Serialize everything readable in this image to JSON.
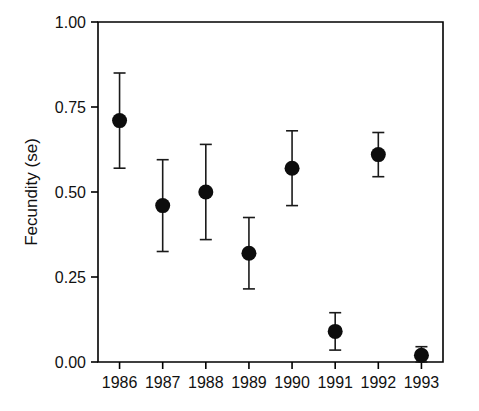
{
  "chart_data": {
    "type": "scatter",
    "title": "",
    "xlabel": "",
    "ylabel": "Fecundity (se)",
    "categories": [
      "1986",
      "1987",
      "1988",
      "1989",
      "1990",
      "1991",
      "1992",
      "1993"
    ],
    "values": [
      0.71,
      0.46,
      0.5,
      0.32,
      0.57,
      0.09,
      0.61,
      0.02
    ],
    "errors": [
      0.14,
      0.135,
      0.14,
      0.105,
      0.11,
      0.055,
      0.065,
      0.025
    ],
    "error_type": "se",
    "ylim": [
      0.0,
      1.0
    ],
    "yticks": [
      0.0,
      0.25,
      0.5,
      0.75,
      1.0
    ],
    "ytick_labels": [
      "0.00",
      "0.25",
      "0.50",
      "0.75",
      "1.00"
    ],
    "xtick_labels": [
      "1986",
      "1987",
      "1988",
      "1989",
      "1990",
      "1991",
      "1992",
      "1993"
    ],
    "grid": false,
    "legend": false,
    "marker": "filled-circle",
    "marker_color": "#0d0d0d",
    "points": [
      {
        "x": "1986",
        "y": 0.71,
        "err": 0.14,
        "low": 0.57,
        "high": 0.85
      },
      {
        "x": "1987",
        "y": 0.46,
        "err": 0.135,
        "low": 0.325,
        "high": 0.595
      },
      {
        "x": "1988",
        "y": 0.5,
        "err": 0.14,
        "low": 0.36,
        "high": 0.64
      },
      {
        "x": "1989",
        "y": 0.32,
        "err": 0.105,
        "low": 0.215,
        "high": 0.425
      },
      {
        "x": "1990",
        "y": 0.57,
        "err": 0.11,
        "low": 0.46,
        "high": 0.68
      },
      {
        "x": "1991",
        "y": 0.09,
        "err": 0.055,
        "low": 0.035,
        "high": 0.145
      },
      {
        "x": "1992",
        "y": 0.61,
        "err": 0.065,
        "low": 0.545,
        "high": 0.675
      },
      {
        "x": "1993",
        "y": 0.02,
        "err": 0.025,
        "low": 0.0,
        "high": 0.045
      }
    ]
  },
  "axes": {
    "y_title": "Fecundity (se)"
  }
}
